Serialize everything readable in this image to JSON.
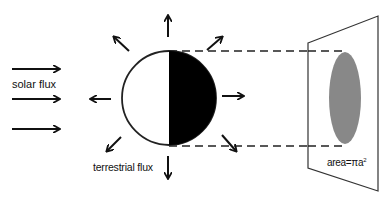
{
  "labels": {
    "solar_flux": "solar flux",
    "terrestrial_flux": "terrestrial flux",
    "area_prefix": "area=πa",
    "area_exponent": "2"
  },
  "colors": {
    "ink": "#111111",
    "shadow_disk": "#888888",
    "night_side": "#000000",
    "day_side": "#ffffff"
  },
  "diagram": {
    "planet": {
      "cx": 169,
      "cy": 98,
      "r": 47
    },
    "solar_arrows_y": [
      69,
      99,
      129
    ],
    "projection_lines_y": [
      51,
      146
    ],
    "plane": {
      "points": "308,43 378,16 378,191 308,168"
    },
    "shadow_ellipse": {
      "cx": 345,
      "cy": 98,
      "rx": 16,
      "ry": 46
    }
  }
}
